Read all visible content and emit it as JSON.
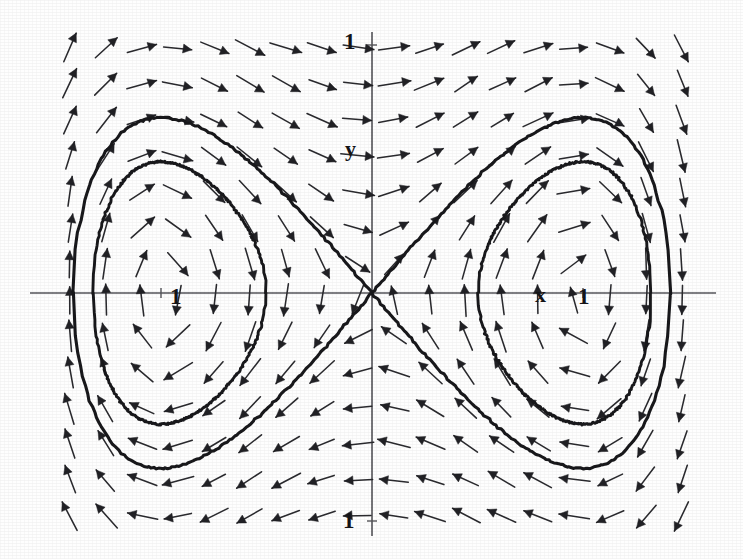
{
  "figure": {
    "kind": "phase-portrait",
    "width": 743,
    "height": 559,
    "background_color": "#ffffff",
    "ink_color": "#18181b",
    "axis_color": "#55555a"
  },
  "labels": {
    "y_axis_name": "y",
    "x_axis_name": "x",
    "y_top_tick": "1",
    "y_bottom_tick": "1",
    "x_left_tick": "1",
    "x_right_tick": "1"
  },
  "chart_data": {
    "type": "scatter",
    "title": "",
    "xlabel": "x",
    "ylabel": "y",
    "xlim": [
      -2.17,
      1.9
    ],
    "ylim": [
      -1.62,
      1.62
    ],
    "grid": false,
    "legend": null,
    "annotations": [
      {
        "text": "1",
        "x": -1.0,
        "y": 0.0,
        "role": "x-axis tick label"
      },
      {
        "text": "1",
        "x": 1.0,
        "y": 0.0,
        "role": "x-axis tick label"
      },
      {
        "text": "1",
        "x": 0.0,
        "y": 1.0,
        "role": "y-axis tick label"
      },
      {
        "text": "1",
        "x": 0.0,
        "y": -1.0,
        "role": "y-axis tick label"
      },
      {
        "text": "x",
        "x": 0.82,
        "y": 0.0,
        "role": "axis name"
      },
      {
        "text": "y",
        "x": 0.0,
        "y": 0.82,
        "role": "axis name"
      }
    ],
    "vector_field": {
      "system": "xdot = y ,  ydot = x - x^3",
      "description": "Unit-normalised direction arrows on a regular grid",
      "grid_columns": 18,
      "grid_rows": 14,
      "arrow_pixel_spacing_x": 36,
      "arrow_pixel_spacing_y": 36,
      "arrow_pixel_length": 30,
      "origin_pixel": [
        372,
        293
      ],
      "pixels_per_unit_x": 211,
      "pixels_per_unit_y": 248
    },
    "fixed_points": [
      {
        "x": 0.0,
        "y": 0.0,
        "type": "saddle"
      },
      {
        "x": -1.0,
        "y": 0.0,
        "type": "center"
      },
      {
        "x": 1.0,
        "y": 0.0,
        "type": "center"
      }
    ],
    "curves": [
      {
        "name": "separatrix-figure-eight",
        "energy": 0.0,
        "description": "Homoclinic loops of the saddle at the origin forming the figure-eight",
        "closed": true
      },
      {
        "name": "inner-orbit-left",
        "energy": -0.11,
        "description": "Closed periodic orbit around the left centre (-1,0)",
        "closed": true
      },
      {
        "name": "inner-orbit-right",
        "energy": -0.11,
        "description": "Closed periodic orbit around the right centre (1,0)",
        "closed": true
      }
    ]
  }
}
